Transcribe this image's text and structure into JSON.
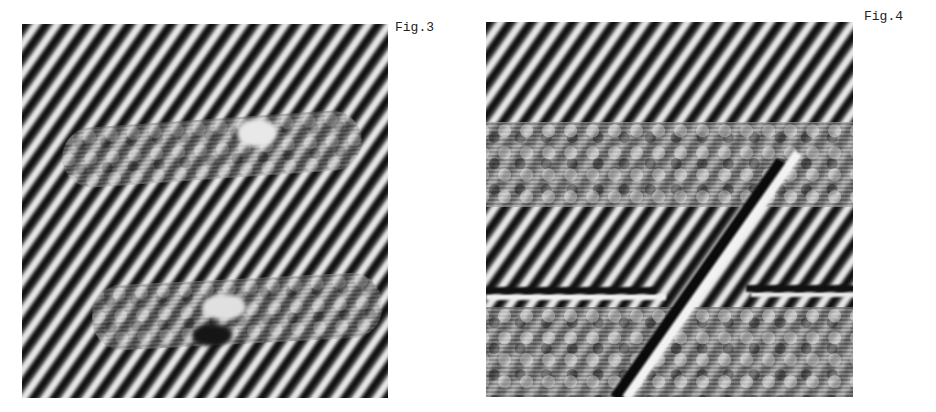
{
  "figures": [
    {
      "id": "fig3",
      "caption": "Fig.3",
      "description": "Lattice fringe micrograph with diagonal stripes and two disordered horizontal bands"
    },
    {
      "id": "fig4",
      "caption": "Fig.4",
      "description": "Lattice fringe micrograph with two broad disordered regions and a diagonal dislocation line"
    }
  ],
  "colors": {
    "dark_fringe": "#0c0c0c",
    "light_fringe": "#efefef",
    "background": "#ffffff"
  }
}
